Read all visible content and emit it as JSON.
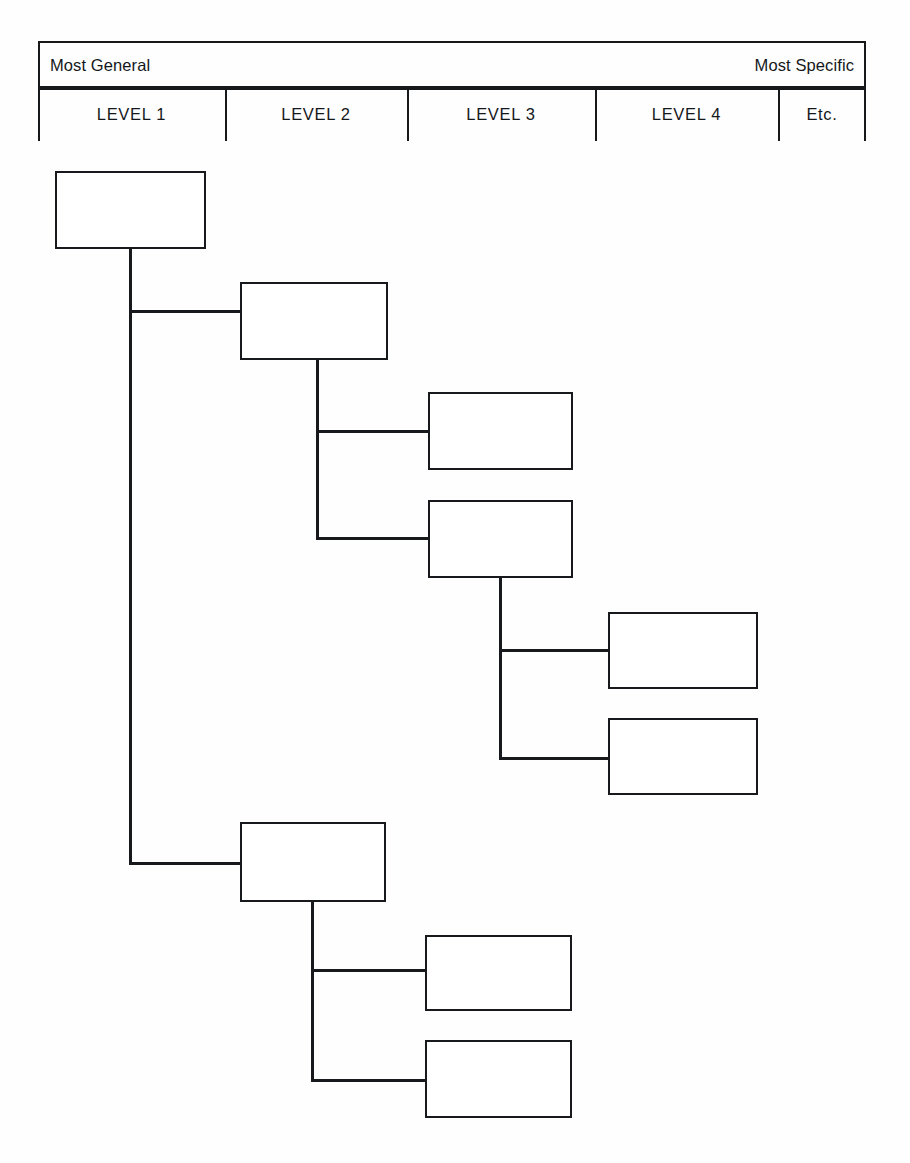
{
  "diagram": {
    "scale": {
      "left_label": "Most General",
      "right_label": "Most Specific"
    },
    "columns": [
      {
        "id": "level-1",
        "label": "LEVEL 1"
      },
      {
        "id": "level-2",
        "label": "LEVEL 2"
      },
      {
        "id": "level-3",
        "label": "LEVEL 3"
      },
      {
        "id": "level-4",
        "label": "LEVEL 4"
      },
      {
        "id": "etc",
        "label": "Etc."
      }
    ],
    "nodes": [
      {
        "id": "n1",
        "level": 1,
        "label": ""
      },
      {
        "id": "n2",
        "level": 2,
        "label": ""
      },
      {
        "id": "n3",
        "level": 3,
        "label": ""
      },
      {
        "id": "n4",
        "level": 3,
        "label": ""
      },
      {
        "id": "n5",
        "level": 4,
        "label": ""
      },
      {
        "id": "n6",
        "level": 4,
        "label": ""
      },
      {
        "id": "n7",
        "level": 2,
        "label": ""
      },
      {
        "id": "n8",
        "level": 3,
        "label": ""
      },
      {
        "id": "n9",
        "level": 3,
        "label": ""
      }
    ],
    "colors": {
      "line": "#17191c",
      "box_fill": "#ffffff",
      "background": "#fefefe",
      "text": "#15181b"
    }
  }
}
